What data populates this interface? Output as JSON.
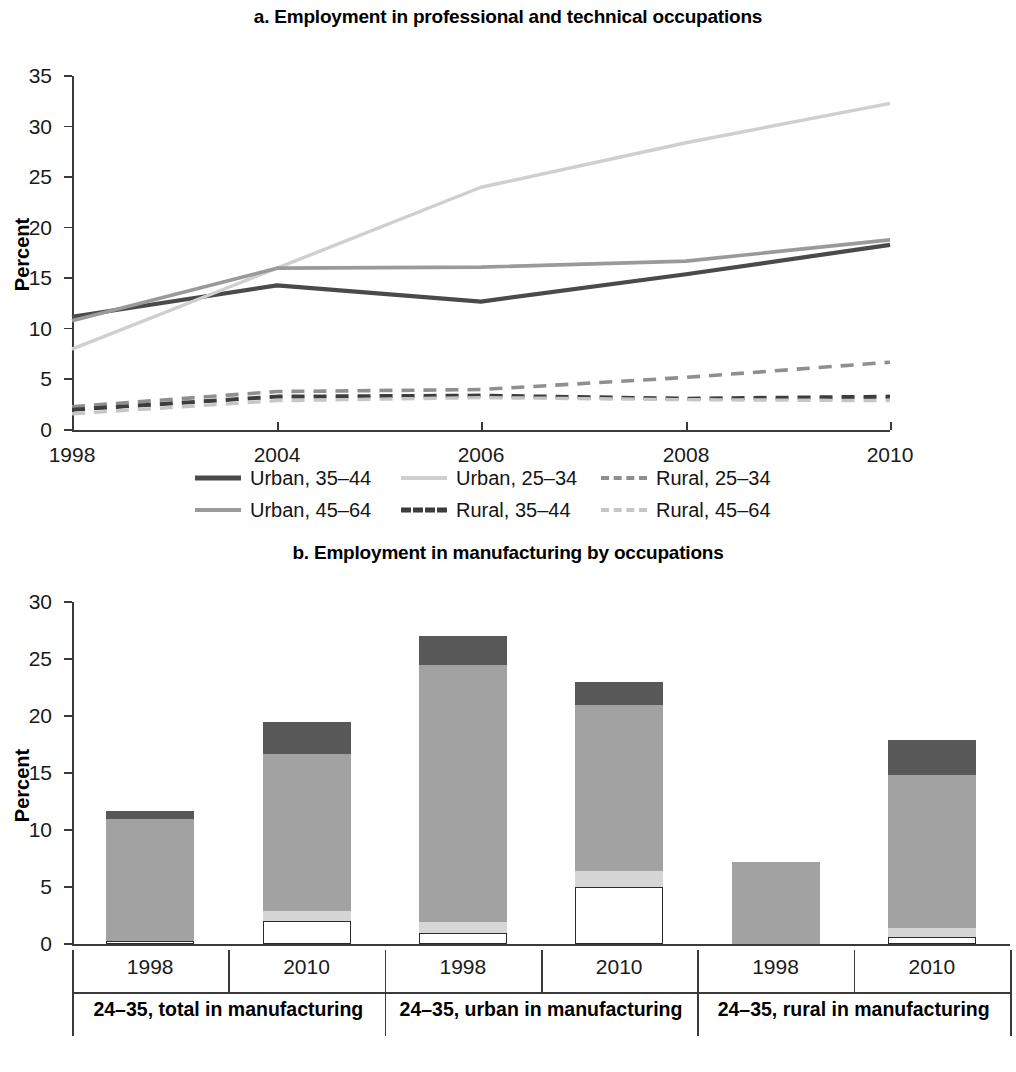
{
  "chart_data": [
    {
      "type": "line",
      "panel": "a",
      "title": "a. Employment in professional and technical occupations",
      "xlabel": "",
      "ylabel": "Percent",
      "ylim": [
        0,
        35
      ],
      "yticks": [
        0,
        5,
        10,
        15,
        20,
        25,
        30,
        35
      ],
      "x": [
        "1998",
        "2004",
        "2006",
        "2008",
        "2010"
      ],
      "grid": false,
      "legend_position": "bottom",
      "series": [
        {
          "name": "Urban, 35–44",
          "values": [
            11.2,
            14.3,
            12.7,
            15.4,
            18.3
          ],
          "style": "solid",
          "color": "#4a4a4a",
          "width": 4.2
        },
        {
          "name": "Urban, 25–34",
          "values": [
            8.0,
            16.0,
            24.0,
            28.4,
            32.3
          ],
          "style": "solid",
          "color": "#cfcfcf",
          "width": 3.4
        },
        {
          "name": "Rural, 25–34",
          "values": [
            2.3,
            3.8,
            4.0,
            5.2,
            6.7
          ],
          "style": "dashed",
          "color": "#8f8f8f",
          "width": 3.6
        },
        {
          "name": "Urban, 45–64",
          "values": [
            10.8,
            16.0,
            16.1,
            16.7,
            18.8
          ],
          "style": "solid",
          "color": "#9a9a9a",
          "width": 3.6
        },
        {
          "name": "Rural, 35–44",
          "values": [
            2.0,
            3.3,
            3.4,
            3.1,
            3.3
          ],
          "style": "dashed",
          "color": "#3d3d3d",
          "width": 4.0
        },
        {
          "name": "Rural, 45–64",
          "values": [
            1.6,
            2.9,
            3.2,
            3.0,
            2.9
          ],
          "style": "dashed",
          "color": "#c6c6c6",
          "width": 3.4
        }
      ]
    },
    {
      "type": "bar",
      "panel": "b",
      "subtype": "stacked",
      "title": "b. Employment in manufacturing by occupations",
      "xlabel": "",
      "ylabel": "Percent",
      "ylim": [
        0,
        30
      ],
      "yticks": [
        0,
        5,
        10,
        15,
        20,
        25,
        30
      ],
      "grid": false,
      "legend_position": "bottom",
      "groups": [
        {
          "label": "24–35, total in manufacturing",
          "years": [
            "1998",
            "2010"
          ]
        },
        {
          "label": "24–35, urban in manufacturing",
          "years": [
            "1998",
            "2010"
          ]
        },
        {
          "label": "24–35, rural in manufacturing",
          "years": [
            "1998",
            "2010"
          ]
        }
      ],
      "categories": [
        "1998",
        "2010",
        "1998",
        "2010",
        "1998",
        "2010"
      ],
      "stack_order": [
        "Managers, professional, and technical",
        "Clerical, service, and sales",
        "Craftsmen and machine operators",
        "Elementary occupations"
      ],
      "series": [
        {
          "name": "Managers, professional, and technical",
          "color": "#ffffff",
          "values": [
            0.3,
            2.0,
            1.0,
            5.0,
            0.0,
            0.6
          ]
        },
        {
          "name": "Clerical, service, and sales",
          "color": "#d6d6d6",
          "values": [
            0.0,
            0.9,
            0.9,
            1.4,
            0.0,
            0.8
          ]
        },
        {
          "name": "Craftsmen and machine operators",
          "color": "#a2a2a2",
          "values": [
            10.7,
            13.8,
            22.6,
            14.6,
            7.2,
            13.4
          ]
        },
        {
          "name": "Elementary occupations",
          "color": "#585858",
          "values": [
            0.7,
            2.8,
            2.5,
            2.0,
            0.0,
            3.1
          ]
        }
      ],
      "totals": [
        11.7,
        19.5,
        27.0,
        23.0,
        7.2,
        17.9
      ]
    }
  ],
  "panel_a": {
    "title": "a. Employment in professional and technical occupations",
    "ylabel": "Percent",
    "yticks": [
      "35",
      "30",
      "25",
      "20",
      "15",
      "10",
      "5",
      "0"
    ],
    "xticks": [
      "1998",
      "2004",
      "2006",
      "2008",
      "2010"
    ],
    "legend": [
      {
        "label": "Urban, 35–44",
        "style": "solid",
        "color": "#4a4a4a",
        "thickness": "5px"
      },
      {
        "label": "Urban, 25–34",
        "style": "solid",
        "color": "#cfcfcf",
        "thickness": "4px"
      },
      {
        "label": "Rural, 25–34",
        "style": "dashed",
        "color": "#8f8f8f",
        "thickness": "4px"
      },
      {
        "label": "Urban, 45–64",
        "style": "solid",
        "color": "#9a9a9a",
        "thickness": "4px"
      },
      {
        "label": "Rural, 35–44",
        "style": "dashed",
        "color": "#3d3d3d",
        "thickness": "5px"
      },
      {
        "label": "Rural, 45–64",
        "style": "dashed",
        "color": "#c6c6c6",
        "thickness": "4px"
      }
    ]
  },
  "panel_b": {
    "title": "b. Employment in manufacturing by occupations",
    "ylabel": "Percent",
    "yticks": [
      "30",
      "25",
      "20",
      "15",
      "10",
      "5",
      "0"
    ],
    "year_labels": [
      "1998",
      "2010",
      "1998",
      "2010",
      "1998",
      "2010"
    ],
    "group_labels": [
      "24–35, total in manufacturing",
      "24–35, urban in manufacturing",
      "24–35, rural in manufacturing"
    ],
    "legend": [
      {
        "label": "Elementary occupations",
        "color": "#585858",
        "outline": false
      },
      {
        "label": "Clerical, service, and sales",
        "color": "#d6d6d6",
        "outline": false
      },
      {
        "label": "Craftsmen and machine operators",
        "color": "#a2a2a2",
        "outline": false
      },
      {
        "label": "Managers, professional, and technical",
        "color": "#ffffff",
        "outline": true
      }
    ]
  },
  "colors": {
    "elementary": "#585858",
    "craftsmen": "#a2a2a2",
    "clerical": "#d6d6d6",
    "managers": "#ffffff",
    "axis": "#3a3a3a",
    "text": "#1a1a1a"
  }
}
